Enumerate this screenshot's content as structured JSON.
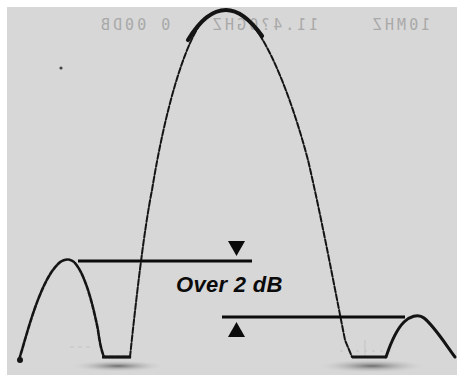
{
  "figure": {
    "annotation": "Over 2 dB",
    "readout": {
      "left": "0 00DB",
      "center": "11.4?0GHZ",
      "right": "10MHZ"
    },
    "colors": {
      "background": "#d7d7d7",
      "trace": "#141414",
      "border": "#ffffff",
      "readout": "#a9a9a9"
    },
    "markers": {
      "upper_line": {
        "x1": 78,
        "x2": 252,
        "y": 261,
        "arrow": "down-triangle",
        "arrow_x": 236
      },
      "lower_line": {
        "x1": 222,
        "x2": 405,
        "y": 317,
        "arrow": "up-triangle",
        "arrow_x": 236
      }
    },
    "trace": {
      "main_lobe_peak": [
        225,
        10
      ],
      "left_sidelobe_peak": [
        67,
        260
      ],
      "right_sidelobe_peak": [
        415,
        316
      ],
      "floor_y": 357
    }
  }
}
